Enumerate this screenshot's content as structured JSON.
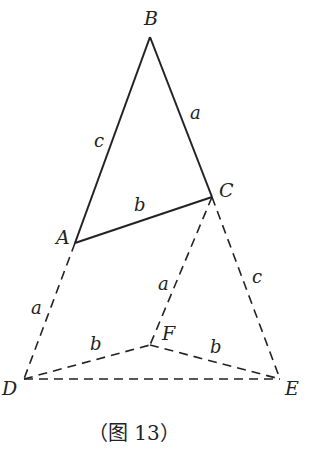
{
  "figure": {
    "caption": "（图 13）",
    "points": {
      "A": {
        "label": "A",
        "x": 75,
        "y": 243
      },
      "B": {
        "label": "B",
        "x": 150,
        "y": 37
      },
      "C": {
        "label": "C",
        "x": 212,
        "y": 197
      },
      "D": {
        "label": "D",
        "x": 24,
        "y": 379
      },
      "E": {
        "label": "E",
        "x": 280,
        "y": 379
      },
      "F": {
        "label": "F",
        "x": 150,
        "y": 345
      }
    },
    "segments": [
      {
        "from": "A",
        "to": "B",
        "label": "c",
        "style": "solid"
      },
      {
        "from": "B",
        "to": "C",
        "label": "a",
        "style": "solid"
      },
      {
        "from": "A",
        "to": "C",
        "label": "b",
        "style": "solid"
      },
      {
        "from": "A",
        "to": "D",
        "label": "a",
        "style": "dashed"
      },
      {
        "from": "C",
        "to": "F",
        "label": "a",
        "style": "dashed"
      },
      {
        "from": "C",
        "to": "E",
        "label": "c",
        "style": "dashed"
      },
      {
        "from": "D",
        "to": "F",
        "label": "b",
        "style": "dashed"
      },
      {
        "from": "F",
        "to": "E",
        "label": "b",
        "style": "dashed"
      },
      {
        "from": "D",
        "to": "E",
        "label": "",
        "style": "dashed"
      }
    ]
  }
}
